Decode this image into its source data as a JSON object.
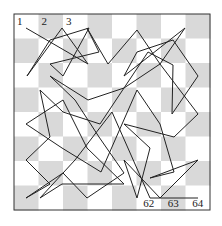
{
  "diagram": {
    "type": "chessboard-tour",
    "board": {
      "rows": 8,
      "cols": 8,
      "origin": [
        14,
        14
      ],
      "square_size": 24.5,
      "light_color": "#ffffff",
      "dark_color": "#d9d9d9",
      "border_color": "#333333",
      "first_square_dark": false
    },
    "line_color": "#222222",
    "labels": [
      {
        "text": "1",
        "col": 0,
        "row": 0,
        "position": "top-left"
      },
      {
        "text": "2",
        "col": 1,
        "row": 0,
        "position": "top-left"
      },
      {
        "text": "3",
        "col": 2,
        "row": 0,
        "position": "top-left"
      },
      {
        "text": "62",
        "col": 5,
        "row": 7,
        "position": "bottom"
      },
      {
        "text": "63",
        "col": 6,
        "row": 7,
        "position": "bottom"
      },
      {
        "text": "64",
        "col": 7,
        "row": 7,
        "position": "bottom"
      }
    ],
    "path": [
      [
        26,
        28
      ],
      [
        88,
        64
      ],
      [
        62,
        28
      ],
      [
        27,
        76
      ],
      [
        50,
        40
      ],
      [
        89,
        28
      ],
      [
        63,
        76
      ],
      [
        50,
        64
      ],
      [
        99,
        52
      ],
      [
        87,
        28
      ],
      [
        108,
        64
      ],
      [
        137,
        30
      ],
      [
        160,
        64
      ],
      [
        185,
        28
      ],
      [
        124,
        76
      ],
      [
        137,
        52
      ],
      [
        173,
        40
      ],
      [
        198,
        76
      ],
      [
        172,
        114
      ],
      [
        173,
        65
      ],
      [
        148,
        52
      ],
      [
        124,
        88
      ],
      [
        100,
        124
      ],
      [
        63,
        112
      ],
      [
        40,
        90
      ],
      [
        50,
        137
      ],
      [
        26,
        160
      ],
      [
        50,
        184
      ],
      [
        26,
        198
      ],
      [
        63,
        173
      ],
      [
        87,
        198
      ],
      [
        124,
        173
      ],
      [
        99,
        137
      ],
      [
        75,
        100
      ],
      [
        50,
        76
      ],
      [
        88,
        100
      ],
      [
        124,
        88
      ],
      [
        160,
        64
      ],
      [
        198,
        114
      ],
      [
        174,
        137
      ],
      [
        124,
        124
      ],
      [
        150,
        148
      ],
      [
        137,
        198
      ],
      [
        124,
        160
      ],
      [
        160,
        198
      ],
      [
        198,
        160
      ],
      [
        150,
        178
      ],
      [
        174,
        172
      ],
      [
        160,
        124
      ],
      [
        137,
        90
      ],
      [
        101,
        172
      ],
      [
        62,
        148
      ],
      [
        26,
        124
      ],
      [
        63,
        100
      ],
      [
        87,
        148
      ],
      [
        124,
        184
      ],
      [
        99,
        184
      ],
      [
        62,
        184
      ],
      [
        40,
        198
      ],
      [
        75,
        160
      ],
      [
        112,
        112
      ],
      [
        150,
        198
      ],
      [
        175,
        198
      ],
      [
        198,
        198
      ]
    ]
  }
}
